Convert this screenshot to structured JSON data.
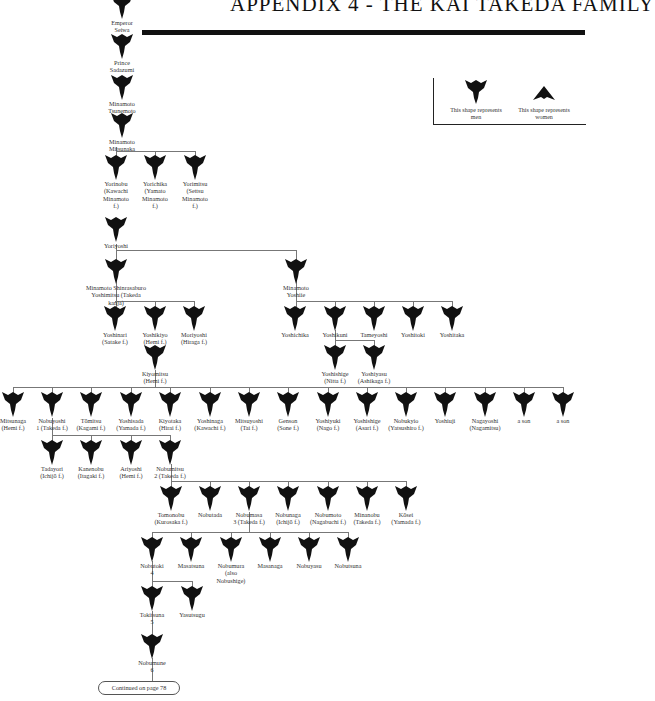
{
  "header": {
    "title": "APPENDIX 4 - THE KAI TAKEDA FAMILY"
  },
  "legend": {
    "men_label": "This shape represents men",
    "women_label": "This shape represents women",
    "men_icon": "men-shape-icon",
    "women_icon": "women-shape-icon"
  },
  "colors": {
    "shape": "#111111",
    "lines": "#777777",
    "text": "#333333"
  },
  "nodes": [
    {
      "id": "sewa",
      "label": "Emperor\nSeiwa",
      "x": 122,
      "y": -6
    },
    {
      "id": "sadazumi",
      "label": "Prince\nSadazumi",
      "x": 122,
      "y": 34
    },
    {
      "id": "tsunemoto",
      "label": "Minamoto\nTsunemoto",
      "x": 122,
      "y": 75
    },
    {
      "id": "mitsunaka",
      "label": "Minamoto\nMitsunaka",
      "x": 122,
      "y": 113
    },
    {
      "id": "yorinobu",
      "label": "Yorinobu\n(Kawachi\nMinamoto\nf.)",
      "x": 116,
      "y": 155
    },
    {
      "id": "yorichika",
      "label": "Yorichika\n(Yamato\nMinamoto\nf.)",
      "x": 155,
      "y": 155
    },
    {
      "id": "yorimitsu",
      "label": "Yorimitsu\n(Settsu\nMinamoto\nf.)",
      "x": 195,
      "y": 155
    },
    {
      "id": "yoriyoshi",
      "label": "Yoriyoshi",
      "x": 116,
      "y": 217
    },
    {
      "id": "yoshimitsu",
      "label": "Minamoto Shinrasaburo\nYoshimitsu (Takeda kanja)",
      "x": 116,
      "y": 259
    },
    {
      "id": "yoshiie",
      "label": "Minamoto\nYoshiie",
      "x": 296,
      "y": 259
    },
    {
      "id": "yoshinari",
      "label": "Yoshinari\n(Satake f.)",
      "x": 115,
      "y": 306
    },
    {
      "id": "yoshikiyo",
      "label": "Yoshikiyo\n(Hemi f.)",
      "x": 155,
      "y": 306
    },
    {
      "id": "moriyoshi",
      "label": "Moriyoshi\n(Hiraga f.)",
      "x": 194,
      "y": 306
    },
    {
      "id": "yoshichika",
      "label": "Yoshichika",
      "x": 295,
      "y": 306
    },
    {
      "id": "yoshikuni",
      "label": "Yoshikuni",
      "x": 335,
      "y": 306
    },
    {
      "id": "tameyoshi",
      "label": "Tameyoshi",
      "x": 374,
      "y": 306
    },
    {
      "id": "yoshitoki",
      "label": "Yoshitoki",
      "x": 413,
      "y": 306
    },
    {
      "id": "yoshitaka",
      "label": "Yoshitaka",
      "x": 452,
      "y": 306
    },
    {
      "id": "kiyomitsu",
      "label": "Kiyomitsu\n(Hemi f.)",
      "x": 155,
      "y": 345
    },
    {
      "id": "yoshishige",
      "label": "Yoshishige\n(Nitta f.)",
      "x": 335,
      "y": 345
    },
    {
      "id": "yoshiyasu",
      "label": "Yoshiyasu\n(Ashikaga f.)",
      "x": 374,
      "y": 345
    },
    {
      "id": "mitsunaga",
      "label": "Mitsunaga\n(Hemi f.)",
      "x": 13,
      "y": 392
    },
    {
      "id": "nobuyoshi",
      "label": "Nobuyoshi\n1 (Takeda f.)",
      "x": 52,
      "y": 392
    },
    {
      "id": "tomitsu",
      "label": "Tōmitsu\n(Kagami f.)",
      "x": 91,
      "y": 392
    },
    {
      "id": "yoshisada",
      "label": "Yoshisada\n(Yamada f.)",
      "x": 131,
      "y": 392
    },
    {
      "id": "kiyotaka",
      "label": "Kiyotaka\n(Hirai f.)",
      "x": 170,
      "y": 392
    },
    {
      "id": "yoshinaga",
      "label": "Yoshinaga\n(Kawachi f.)",
      "x": 210,
      "y": 392
    },
    {
      "id": "mitsuyoshi",
      "label": "Mitsuyoshi\n(Tai f.)",
      "x": 249,
      "y": 392
    },
    {
      "id": "genson",
      "label": "Genson\n(Sone f.)",
      "x": 288,
      "y": 392
    },
    {
      "id": "yoshiyuki",
      "label": "Yoshiyuki\n(Nago f.)",
      "x": 328,
      "y": 392
    },
    {
      "id": "yoshishige2",
      "label": "Yoshishige\n(Asari f.)",
      "x": 367,
      "y": 392
    },
    {
      "id": "nobukyio",
      "label": "Nobukyio\n(Yatsushiro f.)",
      "x": 406,
      "y": 392
    },
    {
      "id": "yoshiuji",
      "label": "Yoshiuji",
      "x": 445,
      "y": 392
    },
    {
      "id": "nagayoshi",
      "label": "Nagayoshi\n(Nagamitsu)",
      "x": 485,
      "y": 392
    },
    {
      "id": "ason1",
      "label": "a son",
      "x": 524,
      "y": 392
    },
    {
      "id": "ason2",
      "label": "a son",
      "x": 563,
      "y": 392
    },
    {
      "id": "tadayori",
      "label": "Tadayori\n(Ichijō f.)",
      "x": 52,
      "y": 440
    },
    {
      "id": "kanenobu",
      "label": "Kanenobu\n(Itagaki f.)",
      "x": 91,
      "y": 440
    },
    {
      "id": "ariyoshi",
      "label": "Ariyoshi\n(Hemi f.)",
      "x": 131,
      "y": 440
    },
    {
      "id": "nobumitsu",
      "label": "Nobumitsu\n2 (Takeda f.)",
      "x": 170,
      "y": 440
    },
    {
      "id": "tomonobu",
      "label": "Tomonobu\n(Kurosaka f.)",
      "x": 171,
      "y": 486
    },
    {
      "id": "nobutada",
      "label": "Nobutada",
      "x": 210,
      "y": 486
    },
    {
      "id": "nobumasa",
      "label": "Nobumasa\n3 (Takeda f.)",
      "x": 249,
      "y": 486
    },
    {
      "id": "nobunaga",
      "label": "Nobunaga\n(Ichijō f.)",
      "x": 288,
      "y": 486
    },
    {
      "id": "nobumoto",
      "label": "Nobumoto\n(Nagabuchi f.)",
      "x": 328,
      "y": 486
    },
    {
      "id": "minanobu",
      "label": "Minanobu\n(Takeda f.)",
      "x": 367,
      "y": 486
    },
    {
      "id": "kosei",
      "label": "Kōsei\n(Yamada f.)",
      "x": 406,
      "y": 486
    },
    {
      "id": "nobutoki",
      "label": "Nobutoki\n4",
      "x": 152,
      "y": 537
    },
    {
      "id": "masatsuna",
      "label": "Masatsuna",
      "x": 191,
      "y": 537
    },
    {
      "id": "nobumura",
      "label": "Nobumura\n(also\nNobushige)",
      "x": 231,
      "y": 537
    },
    {
      "id": "masanaga",
      "label": "Masanaga",
      "x": 270,
      "y": 537
    },
    {
      "id": "nobuyasu",
      "label": "Nobuyasu",
      "x": 309,
      "y": 537
    },
    {
      "id": "nobutsuna",
      "label": "Nobutsuna",
      "x": 348,
      "y": 537
    },
    {
      "id": "tokitsuna",
      "label": "Tokitsuna\n5",
      "x": 152,
      "y": 586
    },
    {
      "id": "yasutsugu",
      "label": "Yasutsugu",
      "x": 192,
      "y": 586
    },
    {
      "id": "nobumune",
      "label": "Nobumune\n6",
      "x": 152,
      "y": 634
    }
  ],
  "footer": {
    "continued_label": "Continued on page 78"
  }
}
